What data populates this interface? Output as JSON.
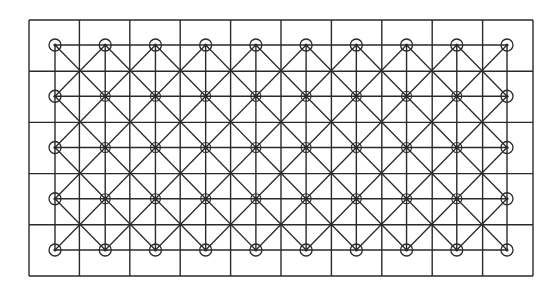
{
  "diagram": {
    "outer_grid": {
      "x0": 29,
      "y0": 20,
      "x1": 533,
      "y1": 276,
      "cols": 10,
      "rows": 5
    },
    "node_lattice": {
      "x0": 55,
      "y0": 45,
      "x1": 507,
      "y1": 250,
      "cols": 10,
      "rows": 5
    },
    "stroke_color": "#2a2a2a",
    "background": "#ffffff",
    "edge_node_radius": 6,
    "interior_node_radius": 5
  }
}
